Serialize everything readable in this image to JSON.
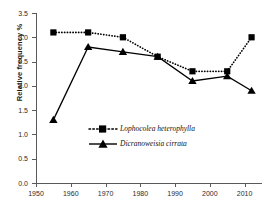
{
  "top_partial_text": "",
  "axis": {
    "ylabel": "Relative frequency %",
    "yticks": [
      "0.0",
      "0.5",
      "1.0",
      "1.5",
      "2.0",
      "2.5",
      "3.0",
      "3.5"
    ],
    "xticks": [
      "1950",
      "1960",
      "1970",
      "1980",
      "1990",
      "2000",
      "2010"
    ]
  },
  "legend": {
    "items": [
      {
        "label": "Lophocolea heterophylla",
        "marker": "square",
        "line": "dotted"
      },
      {
        "label": "Dicranoweisia cirrata",
        "marker": "triangle",
        "line": "solid"
      }
    ]
  },
  "colors": {
    "series": "#000000",
    "axis": "#5a5a5a",
    "text": "#1a1a1a"
  },
  "chart_data": {
    "type": "line",
    "title": "",
    "xlabel": "",
    "ylabel": "Relative frequency %",
    "xlim": [
      1950,
      2015
    ],
    "ylim": [
      0.0,
      3.5
    ],
    "grid": false,
    "legend_position": "center",
    "x": [
      1955,
      1965,
      1975,
      1985,
      1995,
      2005,
      2012
    ],
    "series": [
      {
        "name": "Lophocolea heterophylla",
        "marker": "square",
        "linestyle": "dotted",
        "values": [
          3.1,
          3.1,
          3.0,
          2.6,
          2.3,
          2.3,
          3.0
        ]
      },
      {
        "name": "Dicranoweisia cirrata",
        "marker": "triangle",
        "linestyle": "solid",
        "values": [
          1.3,
          2.8,
          2.7,
          2.6,
          2.1,
          2.2,
          1.9
        ]
      }
    ]
  }
}
